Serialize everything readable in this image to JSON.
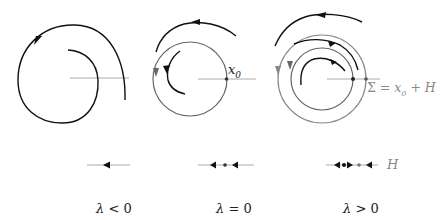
{
  "diagram": {
    "panels": [
      {
        "id": "lambda-negative",
        "caption": "λ < 0",
        "caption_symbol": "λ",
        "caption_relation": "<",
        "caption_value": "0",
        "portrait": "spiral trajectory converging inward",
        "phase_line": "single leftward arrow"
      },
      {
        "id": "lambda-zero",
        "caption": "λ = 0",
        "caption_symbol": "λ",
        "caption_relation": "=",
        "caption_value": "0",
        "portrait": "closed orbit through x0 with inner and outer trajectories",
        "point_label": "x",
        "point_subscript": "0",
        "phase_line": "two leftward arrows around fixed point"
      },
      {
        "id": "lambda-positive",
        "caption": "λ > 0",
        "caption_symbol": "λ",
        "caption_relation": ">",
        "caption_value": "0",
        "portrait": "two nested closed orbits with trajectories",
        "section_label": "Σ = x₀ + H",
        "section_label_parts": {
          "sigma": "Σ",
          "eq": " = ",
          "x": "x",
          "sub": "0",
          "plus": " + ",
          "H": "H"
        },
        "phase_line": "arrows with two fixed points",
        "axis_label": "H"
      }
    ],
    "colors": {
      "trajectory": "#111111",
      "orbit": "#777777",
      "axis": "#aaaaaa",
      "label_gray": "#888888"
    }
  }
}
